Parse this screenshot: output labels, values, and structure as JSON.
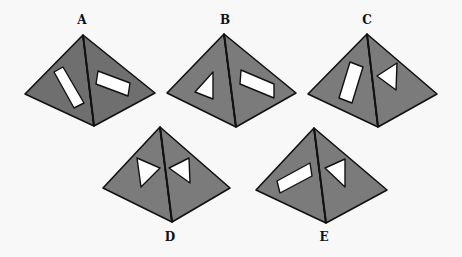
{
  "figure": {
    "type": "pyramid-options",
    "colors": {
      "face": "#7b7b7b",
      "face_dark": "#6f6f6f",
      "edge": "#111111",
      "hole": "#ffffff",
      "background": "#f8f8f8"
    },
    "options": [
      {
        "label": "A",
        "label_pos": [
          82,
          14
        ],
        "apex": [
          83,
          35
        ],
        "left": [
          25,
          94
        ],
        "right": [
          155,
          93
        ],
        "bottom": [
          94,
          126
        ],
        "dark": true,
        "holes": [
          {
            "face": "left",
            "shape": "rectangle",
            "points": [
              [
                54,
                72
              ],
              [
                63,
                67
              ],
              [
                84,
                103
              ],
              [
                74,
                108
              ]
            ]
          },
          {
            "face": "right",
            "shape": "rectangle",
            "points": [
              [
                98,
                71
              ],
              [
                96,
                84
              ],
              [
                128,
                96
              ],
              [
                130,
                83
              ]
            ]
          }
        ]
      },
      {
        "label": "B",
        "label_pos": [
          225,
          14
        ],
        "apex": [
          224,
          34
        ],
        "left": [
          167,
          93
        ],
        "right": [
          296,
          93
        ],
        "bottom": [
          236,
          127
        ],
        "dark": false,
        "holes": [
          {
            "face": "left",
            "shape": "triangle",
            "points": [
              [
                213,
                72
              ],
              [
                195,
                92
              ],
              [
                213,
                99
              ]
            ]
          },
          {
            "face": "right",
            "shape": "rectangle",
            "points": [
              [
                241,
                70
              ],
              [
                240,
                84
              ],
              [
                274,
                98
              ],
              [
                274,
                84
              ]
            ]
          }
        ]
      },
      {
        "label": "C",
        "label_pos": [
          367,
          14
        ],
        "apex": [
          367,
          34
        ],
        "left": [
          308,
          94
        ],
        "right": [
          437,
          94
        ],
        "bottom": [
          378,
          127
        ],
        "dark": false,
        "holes": [
          {
            "face": "left",
            "shape": "rectangle",
            "points": [
              [
                350,
                62
              ],
              [
                363,
                67
              ],
              [
                352,
                103
              ],
              [
                339,
                98
              ]
            ]
          },
          {
            "face": "right",
            "shape": "triangle",
            "points": [
              [
                377,
                76
              ],
              [
                397,
                63
              ],
              [
                396,
                90
              ]
            ]
          }
        ]
      },
      {
        "label": "D",
        "label_pos": [
          170,
          231
        ],
        "apex": [
          160,
          127
        ],
        "left": [
          103,
          188
        ],
        "right": [
          230,
          188
        ],
        "bottom": [
          172,
          222
        ],
        "dark": false,
        "holes": [
          {
            "face": "left",
            "shape": "triangle",
            "points": [
              [
                137,
                158
              ],
              [
                160,
                168
              ],
              [
                141,
                187
              ]
            ]
          },
          {
            "face": "right",
            "shape": "triangle",
            "points": [
              [
                169,
                168
              ],
              [
                189,
                158
              ],
              [
                190,
                183
              ]
            ]
          }
        ]
      },
      {
        "label": "E",
        "label_pos": [
          324,
          231
        ],
        "apex": [
          314,
          128
        ],
        "left": [
          256,
          190
        ],
        "right": [
          387,
          190
        ],
        "bottom": [
          326,
          223
        ],
        "dark": false,
        "holes": [
          {
            "face": "left",
            "shape": "rectangle",
            "points": [
              [
                277,
                181
              ],
              [
                310,
                163
              ],
              [
                312,
                176
              ],
              [
                280,
                193
              ]
            ]
          },
          {
            "face": "right",
            "shape": "triangle",
            "points": [
              [
                325,
                168
              ],
              [
                345,
                159
              ],
              [
                345,
                187
              ]
            ]
          }
        ]
      }
    ]
  }
}
